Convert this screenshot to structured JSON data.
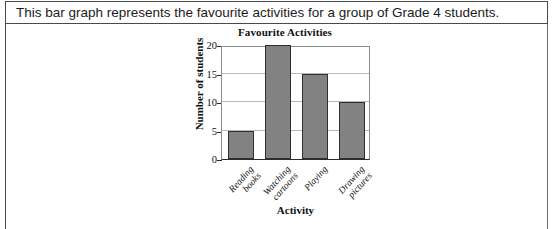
{
  "prompt": {
    "text": "This bar graph represents the favourite activities for a group of Grade 4 students."
  },
  "chart_data": {
    "type": "bar",
    "title": "Favourite Activities",
    "xlabel": "Activity",
    "ylabel": "Number of students",
    "categories": [
      "Reading books",
      "Watching cartoons",
      "Playing",
      "Drawing pictures"
    ],
    "category_lines": [
      [
        "Reading",
        "books"
      ],
      [
        "Watching",
        "cartoons"
      ],
      [
        "Playing"
      ],
      [
        "Drawing",
        "pictures"
      ]
    ],
    "values": [
      5,
      20,
      15,
      10
    ],
    "ylim": [
      0,
      20
    ],
    "yticks": [
      0,
      5,
      10,
      15,
      20
    ],
    "ytick_labels": [
      "0",
      "5",
      "10",
      "15",
      "20"
    ],
    "grid": true,
    "legend": false,
    "bar_fill_color": "#828282",
    "bar_edge_color": "#2f2f2f",
    "gridline_color": "#b9b9b9",
    "axis_color": "#2b2b2b"
  }
}
